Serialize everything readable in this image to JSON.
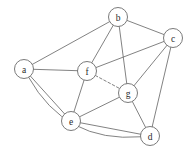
{
  "figure": {
    "width": 193,
    "height": 155,
    "background_color": "#ffffff",
    "edge_color": "#6b6b6b",
    "node_fill_color": "#ffffff",
    "node_stroke_color": "#6b6b6b",
    "label_color": "#2b2b2b",
    "node_radius": 9.5
  },
  "chart_data": {
    "type": "diagram",
    "diagram_kind": "undirected-graph",
    "title": "",
    "node_count": 7,
    "edge_count": 15,
    "nodes": [
      {
        "id": "a",
        "label": "a",
        "x": 24,
        "y": 69
      },
      {
        "id": "b",
        "label": "b",
        "x": 118,
        "y": 17
      },
      {
        "id": "c",
        "label": "c",
        "x": 173,
        "y": 38
      },
      {
        "id": "d",
        "label": "d",
        "x": 150,
        "y": 136
      },
      {
        "id": "e",
        "label": "e",
        "x": 71,
        "y": 121
      },
      {
        "id": "f",
        "label": "f",
        "x": 87,
        "y": 71
      },
      {
        "id": "g",
        "label": "g",
        "x": 128,
        "y": 93
      }
    ],
    "edges": [
      {
        "source": "a",
        "target": "b",
        "style": "solid",
        "shape": "straight"
      },
      {
        "source": "a",
        "target": "f",
        "style": "solid",
        "shape": "straight"
      },
      {
        "source": "a",
        "target": "e",
        "style": "solid",
        "shape": "straight"
      },
      {
        "source": "a",
        "target": "d",
        "style": "solid",
        "shape": "curved",
        "curve_offset": 46
      },
      {
        "source": "b",
        "target": "c",
        "style": "solid",
        "shape": "straight"
      },
      {
        "source": "b",
        "target": "f",
        "style": "solid",
        "shape": "straight"
      },
      {
        "source": "b",
        "target": "g",
        "style": "solid",
        "shape": "straight"
      },
      {
        "source": "c",
        "target": "f",
        "style": "solid",
        "shape": "straight"
      },
      {
        "source": "c",
        "target": "g",
        "style": "solid",
        "shape": "straight"
      },
      {
        "source": "c",
        "target": "d",
        "style": "solid",
        "shape": "straight"
      },
      {
        "source": "e",
        "target": "f",
        "style": "solid",
        "shape": "straight"
      },
      {
        "source": "e",
        "target": "g",
        "style": "solid",
        "shape": "straight"
      },
      {
        "source": "e",
        "target": "d",
        "style": "solid",
        "shape": "straight"
      },
      {
        "source": "g",
        "target": "d",
        "style": "solid",
        "shape": "straight"
      },
      {
        "source": "f",
        "target": "g",
        "style": "dashed",
        "shape": "straight"
      }
    ]
  }
}
